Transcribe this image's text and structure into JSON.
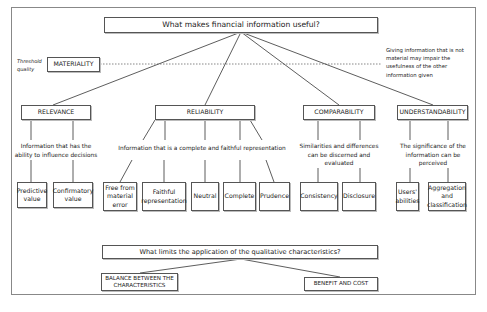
{
  "diagram": {
    "top_question": "What makes financial information useful?",
    "threshold_label": "Threshold quality",
    "materiality": "MATERIALITY",
    "materiality_note": "Giving information that is not material may impair the usefulness of the other information given",
    "characteristics": [
      {
        "label": "RELEVANCE",
        "description": "Information that has the ability to influence decisions",
        "components": [
          "Predictive value",
          "Confirmatory value"
        ]
      },
      {
        "label": "RELIABILITY",
        "description": "Information that is a complete and faithful representation",
        "components": [
          "Free from material error",
          "Faithful representation",
          "Neutral",
          "Complete",
          "Prudence"
        ]
      },
      {
        "label": "COMPARABILITY",
        "description": "Similarities and differences can be discerned and evaluated",
        "components": [
          "Consistency",
          "Disclosure"
        ]
      },
      {
        "label": "UNDERSTANDABILITY",
        "description": "The significance of the information can be perceived",
        "components": [
          "Users' abilities",
          "Aggregation and classification"
        ]
      }
    ],
    "bottom_question": "What limits the application of the qualitative characteristics?",
    "limits": [
      "BALANCE BETWEEN THE CHARACTERISTICS",
      "BENEFIT AND COST"
    ]
  }
}
